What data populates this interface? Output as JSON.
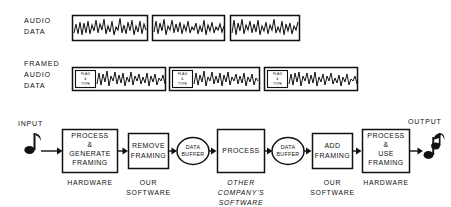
{
  "figure": {
    "ink_color": "#111111",
    "background_color": "#ffffff"
  },
  "rows": {
    "audio_data": {
      "label_lines": [
        "AUDIO",
        "DATA"
      ],
      "segment_count": 3
    },
    "framed_audio_data": {
      "label_lines": [
        "FRAMED",
        "AUDIO",
        "DATA"
      ],
      "segment_count": 3,
      "flag_label_lines": [
        "FLAG",
        "&",
        "TYPE"
      ]
    }
  },
  "flow": {
    "input_label": "INPUT",
    "output_label": "OUTPUT",
    "input_icon": "music-note-icon",
    "output_icon": "music-note-beamed-icon",
    "nodes": [
      {
        "id": "process-generate-framing",
        "shape": "rectangle",
        "label_lines": [
          "PROCESS",
          "&",
          "GENERATE",
          "FRAMING"
        ],
        "under_label_lines": [
          "HARDWARE"
        ],
        "under_label_italic": false
      },
      {
        "id": "remove-framing",
        "shape": "rectangle",
        "label_lines": [
          "REMOVE",
          "FRAMING"
        ],
        "under_label_lines": [
          "OUR",
          "SOFTWARE"
        ],
        "under_label_italic": false
      },
      {
        "id": "data-buffer-1",
        "shape": "ellipse",
        "label_lines": [
          "DATA",
          "BUFFER"
        ],
        "under_label_lines": [],
        "under_label_italic": false
      },
      {
        "id": "process",
        "shape": "rectangle",
        "label_lines": [
          "PROCESS"
        ],
        "under_label_lines": [
          "OTHER",
          "COMPANY'S",
          "SOFTWARE"
        ],
        "under_label_italic": true
      },
      {
        "id": "data-buffer-2",
        "shape": "ellipse",
        "label_lines": [
          "DATA",
          "BUFFER"
        ],
        "under_label_lines": [],
        "under_label_italic": false
      },
      {
        "id": "add-framing",
        "shape": "rectangle",
        "label_lines": [
          "ADD",
          "FRAMING"
        ],
        "under_label_lines": [
          "OUR",
          "SOFTWARE"
        ],
        "under_label_italic": false
      },
      {
        "id": "process-use-framing",
        "shape": "rectangle",
        "label_lines": [
          "PROCESS",
          "&",
          "USE",
          "FRAMING"
        ],
        "under_label_lines": [
          "HARDWARE"
        ],
        "under_label_italic": false
      }
    ]
  }
}
